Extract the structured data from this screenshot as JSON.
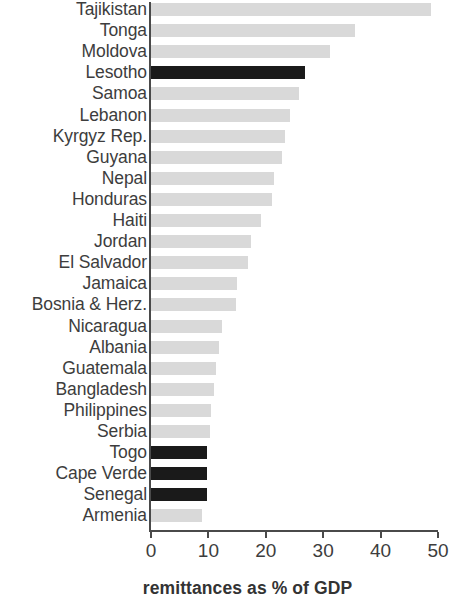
{
  "chart_data": {
    "type": "bar",
    "orientation": "horizontal",
    "title": "",
    "xlabel": "remittances as % of GDP",
    "ylabel": "",
    "xlim": [
      0,
      50
    ],
    "xticks": [
      0,
      10,
      20,
      30,
      40,
      50
    ],
    "xtick_labels": [
      "0",
      "10",
      "20",
      "30",
      "40",
      "50"
    ],
    "grid": false,
    "legend": false,
    "colors": {
      "default_bar": "#d9d9d9",
      "highlight_bar": "#1a1a1a",
      "axis": "#4a4a4a",
      "text": "#3d3d3d",
      "background": "#ffffff"
    },
    "categories": [
      "Tajikistan",
      "Tonga",
      "Moldova",
      "Lesotho",
      "Samoa",
      "Lebanon",
      "Kyrgyz Rep.",
      "Guyana",
      "Nepal",
      "Honduras",
      "Haiti",
      "Jordan",
      "El Salvador",
      "Jamaica",
      "Bosnia & Herz.",
      "Nicaragua",
      "Albania",
      "Guatemala",
      "Bangladesh",
      "Philippines",
      "Serbia",
      "Togo",
      "Cape Verde",
      "Senegal",
      "Armenia"
    ],
    "values": [
      48.8,
      35.6,
      31.1,
      26.8,
      25.8,
      24.2,
      23.3,
      22.8,
      21.4,
      21.1,
      19.2,
      17.4,
      16.9,
      15.0,
      14.8,
      12.3,
      11.9,
      11.3,
      11.0,
      10.5,
      10.2,
      9.8,
      9.8,
      9.8,
      8.9
    ],
    "highlighted": [
      "Lesotho",
      "Togo",
      "Cape Verde",
      "Senegal"
    ],
    "bars": [
      {
        "label": "Tajikistan",
        "value": 48.8,
        "highlight": false
      },
      {
        "label": "Tonga",
        "value": 35.6,
        "highlight": false
      },
      {
        "label": "Moldova",
        "value": 31.1,
        "highlight": false
      },
      {
        "label": "Lesotho",
        "value": 26.8,
        "highlight": true
      },
      {
        "label": "Samoa",
        "value": 25.8,
        "highlight": false
      },
      {
        "label": "Lebanon",
        "value": 24.2,
        "highlight": false
      },
      {
        "label": "Kyrgyz Rep.",
        "value": 23.3,
        "highlight": false
      },
      {
        "label": "Guyana",
        "value": 22.8,
        "highlight": false
      },
      {
        "label": "Nepal",
        "value": 21.4,
        "highlight": false
      },
      {
        "label": "Honduras",
        "value": 21.1,
        "highlight": false
      },
      {
        "label": "Haiti",
        "value": 19.2,
        "highlight": false
      },
      {
        "label": "Jordan",
        "value": 17.4,
        "highlight": false
      },
      {
        "label": "El Salvador",
        "value": 16.9,
        "highlight": false
      },
      {
        "label": "Jamaica",
        "value": 15.0,
        "highlight": false
      },
      {
        "label": "Bosnia & Herz.",
        "value": 14.8,
        "highlight": false
      },
      {
        "label": "Nicaragua",
        "value": 12.3,
        "highlight": false
      },
      {
        "label": "Albania",
        "value": 11.9,
        "highlight": false
      },
      {
        "label": "Guatemala",
        "value": 11.3,
        "highlight": false
      },
      {
        "label": "Bangladesh",
        "value": 11.0,
        "highlight": false
      },
      {
        "label": "Philippines",
        "value": 10.5,
        "highlight": false
      },
      {
        "label": "Serbia",
        "value": 10.2,
        "highlight": false
      },
      {
        "label": "Togo",
        "value": 9.8,
        "highlight": true
      },
      {
        "label": "Cape Verde",
        "value": 9.8,
        "highlight": true
      },
      {
        "label": "Senegal",
        "value": 9.8,
        "highlight": true
      },
      {
        "label": "Armenia",
        "value": 8.9,
        "highlight": false
      }
    ]
  }
}
